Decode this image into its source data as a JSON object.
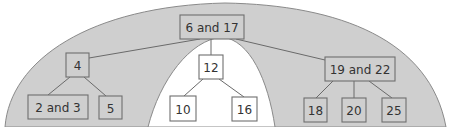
{
  "diagram": {
    "type": "2-3 tree",
    "highlight_color": "#cfcfcf",
    "nodes": [
      {
        "id": "root",
        "label": "6 and 17",
        "highlighted": true
      },
      {
        "id": "n4",
        "label": "4",
        "highlighted": true
      },
      {
        "id": "n2and3",
        "label": "2 and 3",
        "highlighted": true
      },
      {
        "id": "n5",
        "label": "5",
        "highlighted": true
      },
      {
        "id": "n12",
        "label": "12",
        "highlighted": false
      },
      {
        "id": "n10",
        "label": "10",
        "highlighted": false
      },
      {
        "id": "n16",
        "label": "16",
        "highlighted": false
      },
      {
        "id": "n19and22",
        "label": "19 and 22",
        "highlighted": true
      },
      {
        "id": "n18",
        "label": "18",
        "highlighted": true
      },
      {
        "id": "n20",
        "label": "20",
        "highlighted": true
      },
      {
        "id": "n25",
        "label": "25",
        "highlighted": true
      }
    ],
    "edges": [
      [
        "root",
        "n4"
      ],
      [
        "root",
        "n12"
      ],
      [
        "root",
        "n19and22"
      ],
      [
        "n4",
        "n2and3"
      ],
      [
        "n4",
        "n5"
      ],
      [
        "n12",
        "n10"
      ],
      [
        "n12",
        "n16"
      ],
      [
        "n19and22",
        "n18"
      ],
      [
        "n19and22",
        "n20"
      ],
      [
        "n19and22",
        "n25"
      ]
    ]
  }
}
